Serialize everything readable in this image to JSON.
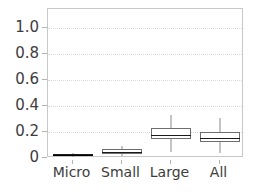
{
  "chart_data": {
    "type": "box",
    "title": "",
    "xlabel": "",
    "ylabel": "",
    "categories": [
      "Micro",
      "Small",
      "Large",
      "All"
    ],
    "ylim": [
      0,
      1.15
    ],
    "yticks": [
      0,
      0.2,
      0.4,
      0.6,
      0.8,
      1.0
    ],
    "ytick_labels": [
      "0",
      "0.2",
      "0.4",
      "0.6",
      "0.8",
      "1.0"
    ],
    "grid": "horizontal-dotted",
    "legend": "none",
    "boxes": [
      {
        "category": "Micro",
        "whisker_low": 0.008,
        "q1": 0.014,
        "median": 0.024,
        "q3": 0.034,
        "whisker_high": 0.042,
        "compressed": true
      },
      {
        "category": "Small",
        "whisker_low": 0.018,
        "q1": 0.03,
        "median": 0.048,
        "q3": 0.072,
        "whisker_high": 0.092
      },
      {
        "category": "Large",
        "whisker_low": 0.05,
        "q1": 0.145,
        "median": 0.18,
        "q3": 0.235,
        "whisker_high": 0.33
      },
      {
        "category": "All",
        "whisker_low": 0.04,
        "q1": 0.125,
        "median": 0.155,
        "q3": 0.2,
        "whisker_high": 0.31
      }
    ]
  },
  "colors": {
    "frame": "#c8c8c8",
    "grid": "#d9d9d9",
    "box_edge": "#6e6e6e",
    "median": "#1a1a1a",
    "whisker": "#8a8a8a",
    "tick_text": "#3d3d3d",
    "background": "#ffffff"
  }
}
